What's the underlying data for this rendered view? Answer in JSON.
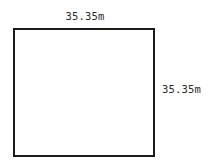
{
  "diagram": {
    "type": "square",
    "shape_name": "square-outline",
    "canvas": {
      "width": 220,
      "height": 167,
      "background_color": "#ffffff"
    },
    "stroke_color": "#1a1a1a",
    "fill_color": "#ffffff",
    "stroke_width": 2,
    "text_color": "#2b2b2b",
    "labels": {
      "top": {
        "text": "35.35m",
        "value": "35.35",
        "unit": "m",
        "side": "top"
      },
      "right": {
        "text": "35.35m",
        "value": "35.35",
        "unit": "m",
        "side": "right"
      }
    }
  }
}
